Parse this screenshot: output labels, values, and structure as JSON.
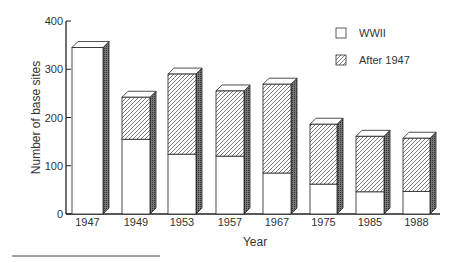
{
  "chart_data": {
    "type": "bar",
    "stacked": true,
    "style": "3d",
    "title": "",
    "xlabel": "Year",
    "ylabel": "Number of base sites",
    "ylim": [
      0,
      400
    ],
    "yticks": [
      0,
      100,
      200,
      300,
      400
    ],
    "categories": [
      "1947",
      "1949",
      "1953",
      "1957",
      "1967",
      "1975",
      "1985",
      "1988"
    ],
    "series": [
      {
        "name": "WWII",
        "pattern": "white",
        "values": [
          345,
          155,
          124,
          120,
          85,
          62,
          46,
          47
        ]
      },
      {
        "name": "After 1947",
        "pattern": "hatched",
        "values": [
          0,
          87,
          166,
          135,
          184,
          124,
          115,
          110
        ]
      }
    ],
    "totals": [
      345,
      242,
      290,
      255,
      269,
      186,
      161,
      157
    ],
    "legend": {
      "position": "top-right",
      "entries": [
        "WWII",
        "After 1947"
      ]
    },
    "grid": false
  }
}
